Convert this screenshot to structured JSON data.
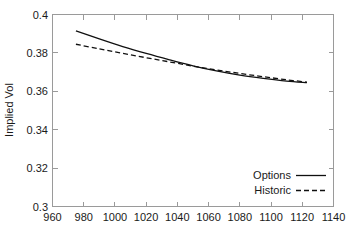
{
  "figure": {
    "background_color": "#ffffff",
    "frame_color": "#9a9a9a",
    "line_color": "#101010"
  },
  "chart_data": {
    "type": "line",
    "title": "",
    "xlabel": "",
    "ylabel": "Implied Vol",
    "xlim": [
      960,
      1140
    ],
    "ylim": [
      0.3,
      0.4
    ],
    "xticks": [
      960,
      980,
      1000,
      1020,
      1040,
      1060,
      1080,
      1100,
      1120,
      1140
    ],
    "xtick_labels": [
      "960",
      "980",
      "1000",
      "1020",
      "1040",
      "1060",
      "1080",
      "1100",
      "1120",
      "1140"
    ],
    "yticks": [
      0.3,
      0.32,
      0.34,
      0.36,
      0.38,
      0.4
    ],
    "ytick_labels": [
      "0.3",
      "0.32",
      "0.34",
      "0.36",
      "0.38",
      "0.4"
    ],
    "grid": false,
    "legend_position": "lower right",
    "x": [
      975,
      990,
      1005,
      1020,
      1035,
      1050,
      1065,
      1080,
      1095,
      1110,
      1123
    ],
    "series": [
      {
        "name": "Options",
        "style": "solid",
        "values": [
          0.3915,
          0.3873,
          0.3833,
          0.3797,
          0.3764,
          0.3733,
          0.3706,
          0.3684,
          0.3667,
          0.3653,
          0.3645
        ]
      },
      {
        "name": "Historic",
        "style": "dashed",
        "values": [
          0.3845,
          0.3821,
          0.3798,
          0.3775,
          0.3753,
          0.3731,
          0.3711,
          0.3693,
          0.3676,
          0.366,
          0.3648
        ]
      }
    ]
  },
  "legend": {
    "entries": [
      {
        "label": "Options",
        "style": "solid"
      },
      {
        "label": "Historic",
        "style": "dashed"
      }
    ]
  }
}
